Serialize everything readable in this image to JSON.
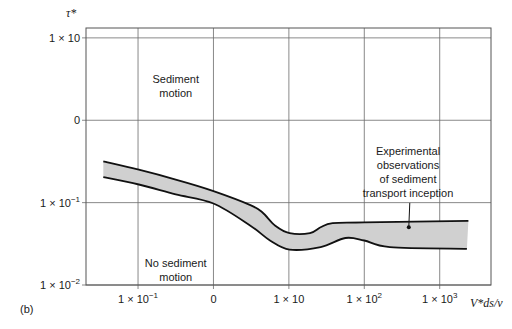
{
  "chart_data": {
    "type": "area",
    "panel_label": "(b)",
    "title": "",
    "xlabel": "V*ds/ν",
    "ylabel": "τ*",
    "x_scale": "log",
    "y_scale": "log",
    "xlim_log10": [
      -1.69,
      3.68
    ],
    "ylim_log10": [
      -2.0,
      1.12
    ],
    "grid": true,
    "x_ticks": [
      {
        "log10": -1,
        "base": "1 × 10",
        "exp": "−1"
      },
      {
        "log10": 0,
        "base": "0",
        "exp": ""
      },
      {
        "log10": 1,
        "base": "1 × 10",
        "exp": ""
      },
      {
        "log10": 2,
        "base": "1 × 10",
        "exp": "2"
      },
      {
        "log10": 3,
        "base": "1 × 10",
        "exp": "3"
      }
    ],
    "y_ticks": [
      {
        "log10": 1,
        "base": "1 × 10",
        "exp": ""
      },
      {
        "log10": 0,
        "base": "0",
        "exp": ""
      },
      {
        "log10": -1,
        "base": "1 × 10",
        "exp": "−1"
      },
      {
        "log10": -2,
        "base": "1 × 10",
        "exp": "−2"
      }
    ],
    "series": [
      {
        "name": "upper bound",
        "points_log10": [
          [
            -1.46,
            -0.5
          ],
          [
            -0.99,
            -0.6
          ],
          [
            -0.5,
            -0.72
          ],
          [
            0,
            -0.86
          ],
          [
            0.49,
            -1.03
          ],
          [
            0.65,
            -1.12
          ],
          [
            0.82,
            -1.28
          ],
          [
            1.01,
            -1.37
          ],
          [
            1.28,
            -1.37
          ],
          [
            1.42,
            -1.3
          ],
          [
            1.58,
            -1.25
          ],
          [
            2.0,
            -1.24
          ],
          [
            3.38,
            -1.22
          ]
        ]
      },
      {
        "name": "lower bound",
        "points_log10": [
          [
            -1.46,
            -0.69
          ],
          [
            -0.99,
            -0.78
          ],
          [
            -0.5,
            -0.9
          ],
          [
            0,
            -1.01
          ],
          [
            0.49,
            -1.28
          ],
          [
            0.75,
            -1.46
          ],
          [
            1.01,
            -1.57
          ],
          [
            1.42,
            -1.54
          ],
          [
            1.75,
            -1.43
          ],
          [
            2.0,
            -1.46
          ],
          [
            2.34,
            -1.54
          ],
          [
            3.36,
            -1.56
          ]
        ]
      }
    ],
    "band_fill_color": "#d0d0d0",
    "annotations": [
      {
        "id": "sediment-motion",
        "lines": [
          "Sediment",
          "motion"
        ],
        "at_log10": [
          -0.5,
          0.45
        ]
      },
      {
        "id": "no-sediment-motion",
        "lines": [
          "No sediment",
          "motion"
        ],
        "at_log10": [
          -0.5,
          -1.78
        ]
      },
      {
        "id": "experimental",
        "lines": [
          "Experimental",
          "observations",
          "of sediment",
          "transport inception"
        ],
        "at_log10": [
          2.58,
          -0.42
        ],
        "pointer_log10": [
          2.59,
          -1.3
        ]
      }
    ]
  }
}
